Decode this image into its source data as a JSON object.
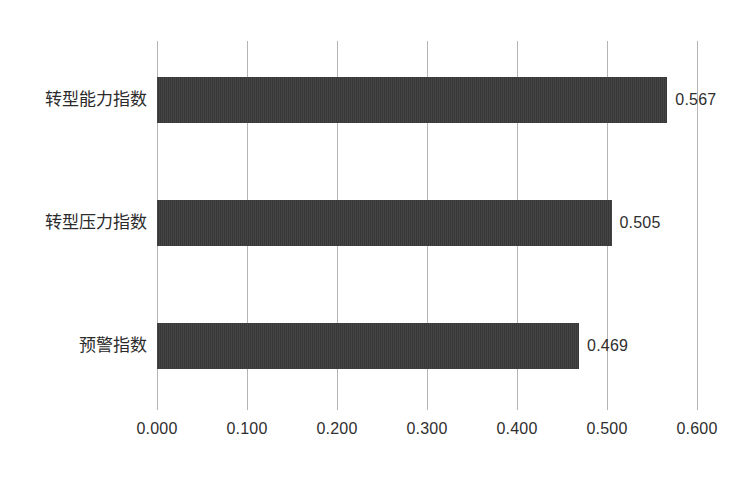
{
  "chart_data": {
    "type": "bar",
    "orientation": "horizontal",
    "title": "",
    "xlabel": "",
    "ylabel": "",
    "categories": [
      "转型能力指数",
      "转型压力指数",
      "预警指数"
    ],
    "values": [
      0.567,
      0.505,
      0.469
    ],
    "value_labels": [
      "0.567",
      "0.505",
      "0.469"
    ],
    "xlim": [
      0.0,
      0.6
    ],
    "xticks": [
      0.0,
      0.1,
      0.2,
      0.3,
      0.4,
      0.5,
      0.6
    ],
    "xtick_labels": [
      "0.000",
      "0.100",
      "0.200",
      "0.300",
      "0.400",
      "0.500",
      "0.600"
    ],
    "grid": "vertical",
    "legend": null,
    "series": [
      {
        "name": "",
        "values": [
          0.567,
          0.505,
          0.469
        ]
      }
    ],
    "colors": {
      "bar": "#3a3a3a",
      "gridline": "#b4b4b4",
      "background": "#ffffff",
      "text": "#2f2f2f"
    }
  }
}
